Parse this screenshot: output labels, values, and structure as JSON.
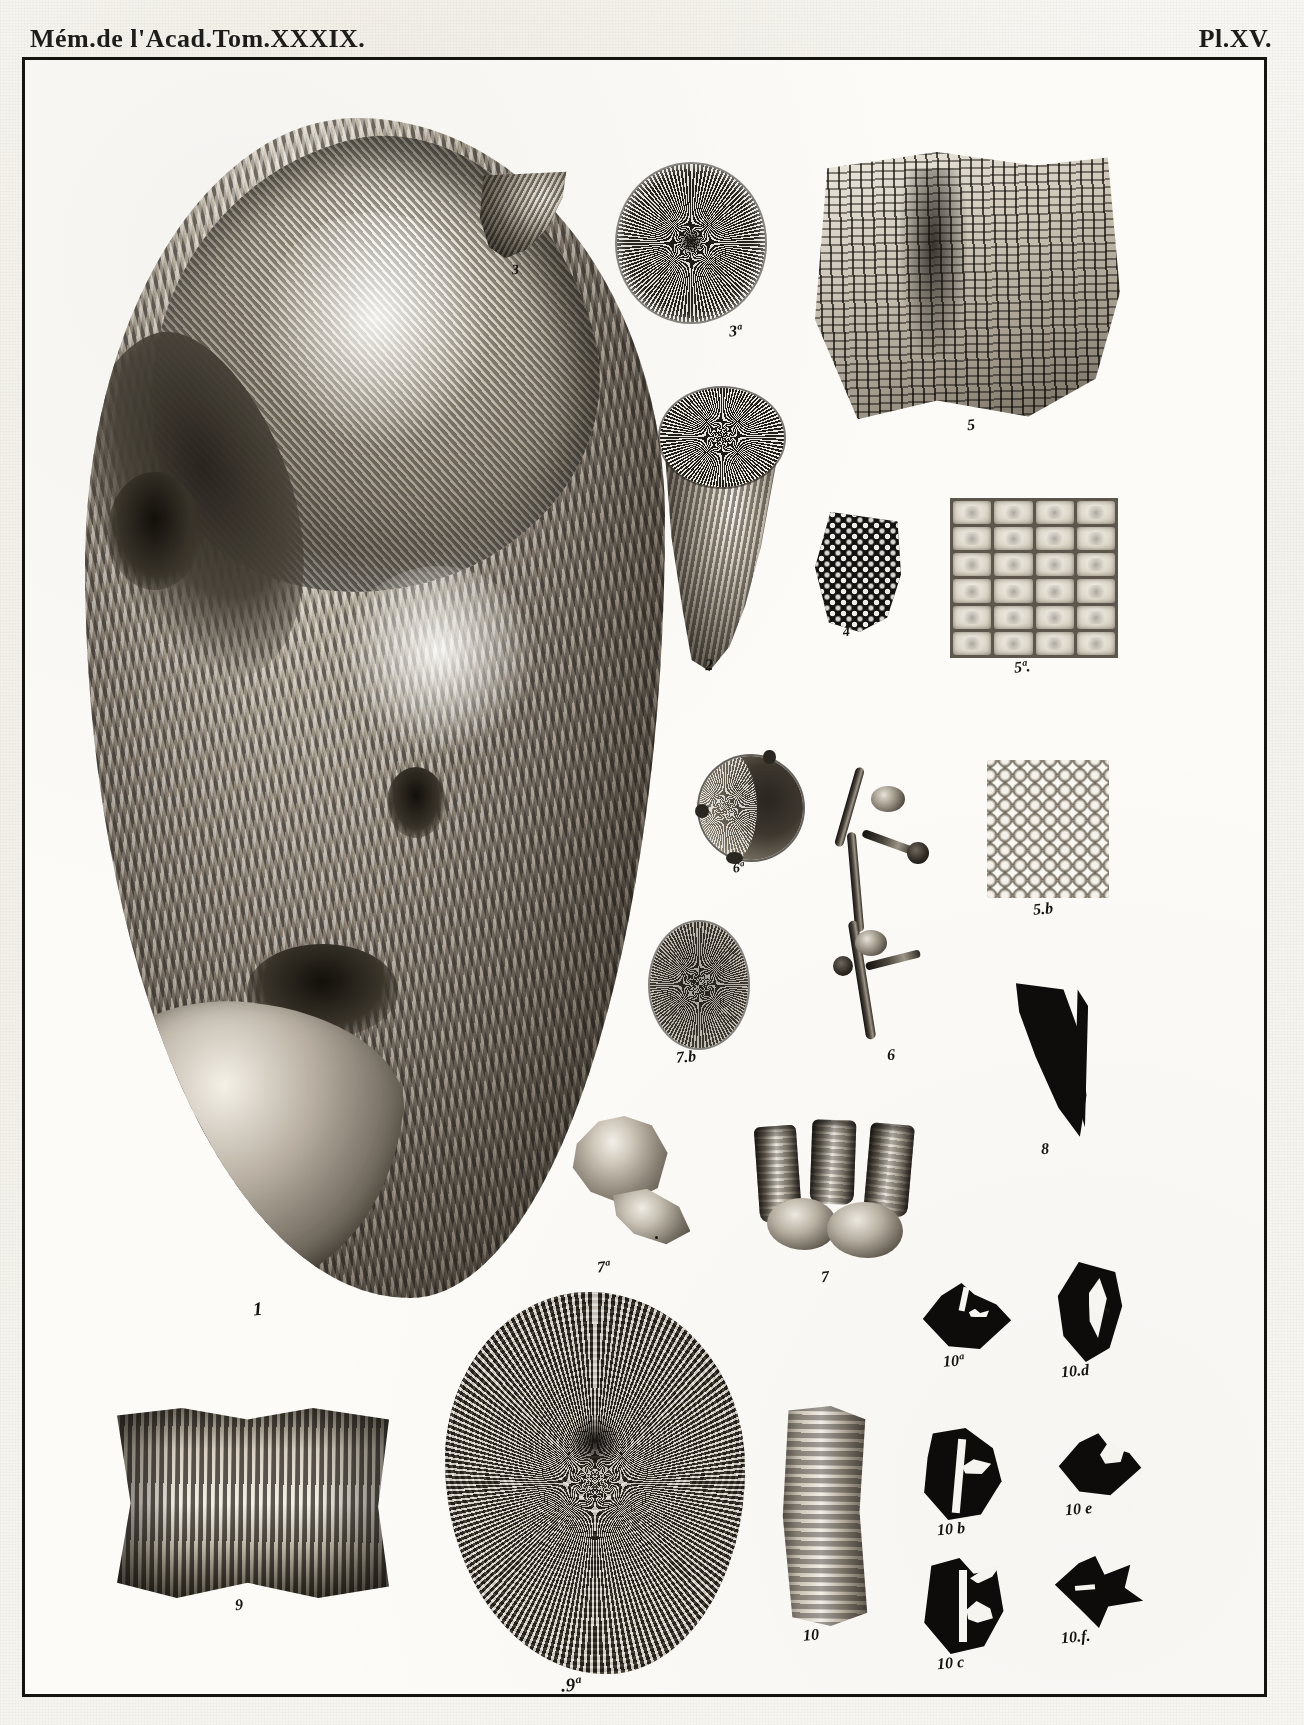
{
  "plate": {
    "header_left": "Mém.de l'Acad.Tom.XXXIX.",
    "header_right": "Pl.XV.",
    "title": "Mémoires de l'Académie, Tome XXXIX — Planche XV",
    "medium": "engraved scientific plate, fossil corals and bryozoans",
    "ink_color": "#141310",
    "paper_color": "#fcfbf8",
    "frame_color": "#15140f"
  },
  "figures": [
    {
      "id": "fig1",
      "caption": "1",
      "name": "large-coral-mass",
      "description": "Very large ribbed conical coral / gastropod-like mass with spiral whorl and broken lip"
    },
    {
      "id": "fig3",
      "caption": "3",
      "name": "small-horn-coral",
      "description": "Small curved horn coral, side view"
    },
    {
      "id": "fig3a",
      "caption": "3ª",
      "name": "radial-calice-disc",
      "description": "Circular calice with dense radiating septa"
    },
    {
      "id": "fig2",
      "caption": "2",
      "name": "conical-horn-coral",
      "description": "Conical horn coral showing the radiating calice at the open end"
    },
    {
      "id": "fig5",
      "caption": "5",
      "name": "reticulate-bryozoan-colony",
      "description": "Large fragment of reticulate bryozoan colony with rectangular mesh"
    },
    {
      "id": "fig4",
      "caption": "4",
      "name": "dark-cellular-fragment",
      "description": "Small dark fragment with polygonal cells"
    },
    {
      "id": "fig5a",
      "caption": "5ª.",
      "name": "magnified-cell-grid",
      "description": "Magnified view: rectangular cells in regular rows and columns"
    },
    {
      "id": "fig6a",
      "caption": "6ª",
      "name": "round-calice",
      "description": "Round calice with thick wall, partly shaded"
    },
    {
      "id": "fig6",
      "caption": "6",
      "name": "branching-coral-twig",
      "description": "Slender branching coral twig with two lateral buds"
    },
    {
      "id": "fig5b",
      "caption": "5.b",
      "name": "rounded-cell-block",
      "description": "Magnified block of rounded, tightly packed cells"
    },
    {
      "id": "fig7b",
      "caption": "7.b",
      "name": "oval-calice",
      "description": "Oval calice with fine radiating septa"
    },
    {
      "id": "fig8",
      "caption": "8",
      "name": "dark-crescent-silhouette",
      "description": "Solid black crescent / claw-shaped silhouette"
    },
    {
      "id": "fig7a",
      "caption": "7ª",
      "name": "flared-cup-coral",
      "description": "Cup coral with flared rim and recurved base"
    },
    {
      "id": "fig7",
      "caption": "7",
      "name": "tubular-corallite-cluster",
      "description": "Cluster of three tubular corallites"
    },
    {
      "id": "fig9",
      "caption": "9",
      "name": "ribbed-cylindrical-segment",
      "description": "Ribbed cylindrical stem segment, lateral view"
    },
    {
      "id": "fig9a",
      "caption": ".9ª",
      "name": "reticulate-fungid-disc",
      "description": "Large circular fungid disc with radiating and concentric reticulation"
    },
    {
      "id": "fig10",
      "caption": "10",
      "name": "pale-ribbed-fragment",
      "description": "Pale vertical ribbed fragment"
    },
    {
      "id": "fig10a",
      "caption": "10ª",
      "name": "silhouette-section-a",
      "description": "Black rhomboid cross-section silhouette"
    },
    {
      "id": "fig10b",
      "caption": "10 b",
      "name": "silhouette-section-b",
      "description": "Black crescent cross-section silhouette"
    },
    {
      "id": "fig10c",
      "caption": "10 c",
      "name": "silhouette-section-c",
      "description": "Black irregular cross-section silhouette"
    },
    {
      "id": "fig10d",
      "caption": "10.d",
      "name": "silhouette-section-d",
      "description": "Black lenticular cross-section silhouette"
    },
    {
      "id": "fig10e",
      "caption": "10 e",
      "name": "silhouette-section-e",
      "description": "Black rhomboid cross-section silhouette with light streak"
    },
    {
      "id": "fig10f",
      "caption": "10.f.",
      "name": "silhouette-section-f",
      "description": "Black star-like cross-section silhouette"
    }
  ]
}
